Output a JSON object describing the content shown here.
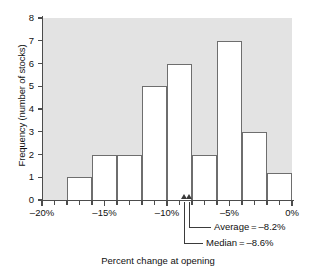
{
  "chart_data": {
    "type": "bar",
    "title": "",
    "xlabel": "Percent change at opening",
    "ylabel": "Frequency (number of stocks)",
    "xlim": [
      -20,
      0
    ],
    "ylim": [
      0,
      8
    ],
    "grid": false,
    "legend": "none",
    "bin_width": 2,
    "bin_edges": [
      -20,
      -18,
      -16,
      -14,
      -12,
      -10,
      -8,
      -6,
      -4,
      -2,
      0
    ],
    "categories": [
      "-20% to -18%",
      "-18% to -16%",
      "-16% to -14%",
      "-14% to -12%",
      "-12% to -10%",
      "-10% to -8%",
      "-8% to -6%",
      "-6% to -4%",
      "-4% to -2%",
      "-2% to 0%"
    ],
    "values": [
      0,
      1,
      2,
      2,
      5,
      6,
      2,
      7,
      3,
      1.2
    ],
    "xticklabels": [
      "-20%",
      "-15%",
      "-10%",
      "-5%",
      "0%"
    ],
    "xtickvalues": [
      -20,
      -15,
      -10,
      -5,
      0
    ],
    "yticklabels": [
      "0",
      "1",
      "2",
      "3",
      "4",
      "5",
      "6",
      "7",
      "8"
    ],
    "ytickvalues": [
      0,
      1,
      2,
      3,
      4,
      5,
      6,
      7,
      8
    ],
    "annotations": [
      {
        "name": "average",
        "label": "Average = –8.2%",
        "value": -8.2
      },
      {
        "name": "median",
        "label": "Median = –8.6%",
        "value": -8.6
      }
    ],
    "colors": {
      "plot_background": "#e3e3e3",
      "bar_fill": "#ffffff",
      "bar_edge": "#6e6e6e",
      "axis": "#4c4c4c",
      "text": "#111111"
    }
  },
  "axes": {
    "y_title": "Frequency (number of stocks)",
    "x_title": "Percent change at opening"
  },
  "ylabels": {
    "t0": "0",
    "t1": "1",
    "t2": "2",
    "t3": "3",
    "t4": "4",
    "t5": "5",
    "t6": "6",
    "t7": "7",
    "t8": "8"
  },
  "xlabels": {
    "t0": "-20%",
    "t1": "-15%",
    "t2": "-10%",
    "t3": "-5%",
    "t4": "0%"
  },
  "notes": {
    "average": "Average = –8.2%",
    "median": "Median = –8.6%"
  }
}
